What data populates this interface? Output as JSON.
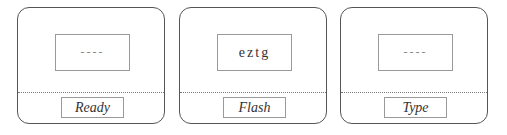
{
  "panels": [
    {
      "display": "----",
      "label": "Ready"
    },
    {
      "display": "eztg",
      "label": "Flash"
    },
    {
      "display": "----",
      "label": "Type"
    }
  ]
}
